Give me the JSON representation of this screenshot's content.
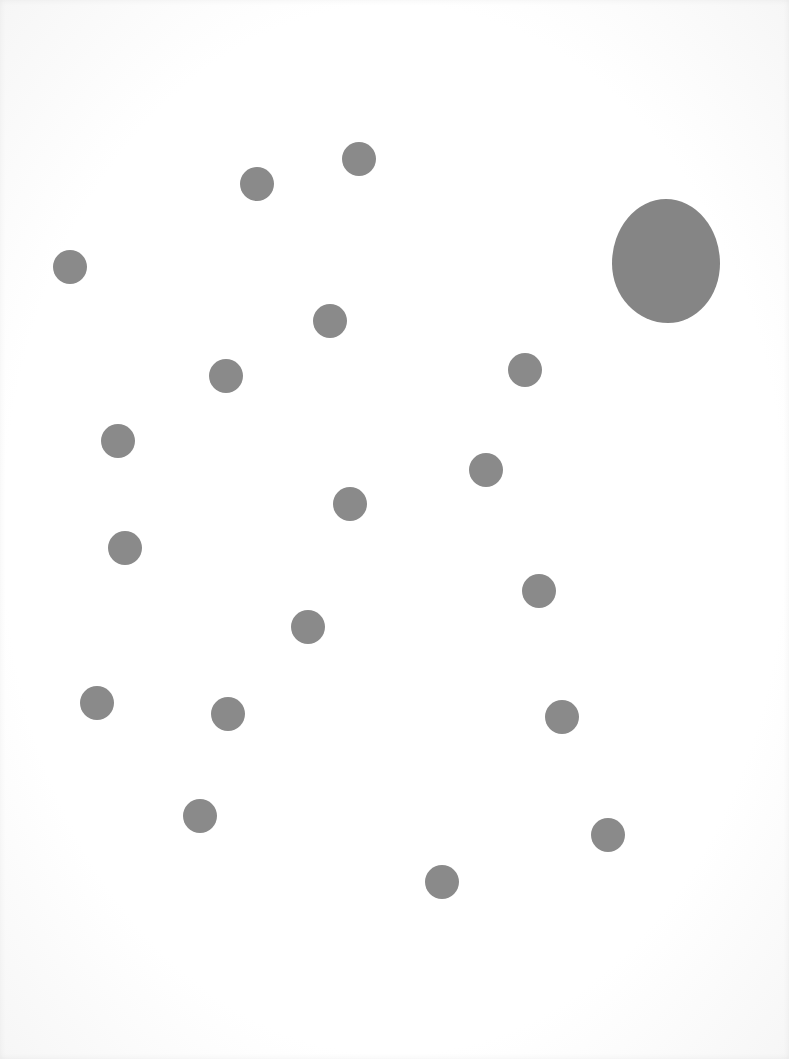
{
  "page": {
    "background": "#ffffff",
    "dot_color": "#8a8a8a"
  },
  "big_dot": {
    "cx": 666,
    "cy": 261,
    "w": 108,
    "h": 124,
    "color": "#858585"
  },
  "dots": [
    {
      "cx": 257,
      "cy": 184,
      "r": 17
    },
    {
      "cx": 359,
      "cy": 159,
      "r": 17
    },
    {
      "cx": 70,
      "cy": 267,
      "r": 17
    },
    {
      "cx": 330,
      "cy": 321,
      "r": 17
    },
    {
      "cx": 226,
      "cy": 376,
      "r": 17
    },
    {
      "cx": 525,
      "cy": 370,
      "r": 17
    },
    {
      "cx": 118,
      "cy": 441,
      "r": 17
    },
    {
      "cx": 486,
      "cy": 470,
      "r": 17
    },
    {
      "cx": 350,
      "cy": 504,
      "r": 17
    },
    {
      "cx": 125,
      "cy": 548,
      "r": 17
    },
    {
      "cx": 539,
      "cy": 591,
      "r": 17
    },
    {
      "cx": 308,
      "cy": 627,
      "r": 17
    },
    {
      "cx": 97,
      "cy": 703,
      "r": 17
    },
    {
      "cx": 228,
      "cy": 714,
      "r": 17
    },
    {
      "cx": 562,
      "cy": 717,
      "r": 17
    },
    {
      "cx": 200,
      "cy": 816,
      "r": 17
    },
    {
      "cx": 608,
      "cy": 835,
      "r": 17
    },
    {
      "cx": 442,
      "cy": 882,
      "r": 17
    }
  ]
}
